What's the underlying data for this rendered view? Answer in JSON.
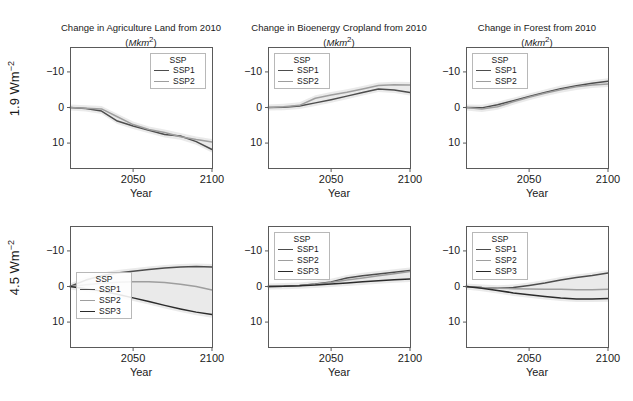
{
  "figure": {
    "row_labels": [
      "1.9 Wm−2",
      "4.5 Wm−2"
    ],
    "x_axis_label": "Year",
    "x_ticks": [
      "2050",
      "2100"
    ],
    "y_ticks": [
      "10",
      "0",
      "−10"
    ],
    "legend_title": "SSP",
    "colors": {
      "SSP1": "#4d4d4d",
      "SSP2": "#9e9e9e",
      "SSP3": "#2b2b2b",
      "frame": "#5a5a5a",
      "ribbon": "#d9d9d9",
      "background": "#ffffff",
      "text": "#1a1a1a"
    }
  },
  "chart_data": [
    {
      "id": "agriculture-1p9",
      "type": "line",
      "title": "Change in Agriculture Land from 2010",
      "subtitle": "(Mkm2)",
      "row": "1.9 Wm−2",
      "column": "Agriculture Land",
      "xlabel": "Year",
      "ylabel": "1.9 Wm−2",
      "xlim": [
        2010,
        2100
      ],
      "ylim": [
        -17,
        17
      ],
      "xticks": [
        2050,
        2100
      ],
      "yticks": [
        -10,
        0,
        10
      ],
      "grid": false,
      "legend_position": "top-right",
      "legend_entries": [
        "SSP1",
        "SSP2"
      ],
      "x": [
        2010,
        2020,
        2030,
        2040,
        2050,
        2060,
        2070,
        2080,
        2090,
        2100
      ],
      "series": [
        {
          "name": "SSP1",
          "values": [
            0.0,
            -0.3,
            -1.0,
            -3.8,
            -5.2,
            -6.4,
            -7.6,
            -8.0,
            -9.6,
            -11.8
          ]
        },
        {
          "name": "SSP2",
          "values": [
            0.0,
            -0.2,
            -0.4,
            -2.6,
            -4.8,
            -6.2,
            -7.0,
            -8.2,
            -9.0,
            -9.7
          ]
        }
      ]
    },
    {
      "id": "bioenergy-1p9",
      "type": "line",
      "title": "Change in Bioenergy Cropland from 2010",
      "subtitle": "(Mkm2)",
      "row": "1.9 Wm−2",
      "column": "Bioenergy Cropland",
      "xlabel": "Year",
      "ylabel": "1.9 Wm−2",
      "xlim": [
        2010,
        2100
      ],
      "ylim": [
        -17,
        17
      ],
      "xticks": [
        2050,
        2100
      ],
      "yticks": [
        -10,
        0,
        10
      ],
      "grid": false,
      "legend_position": "top-left",
      "legend_entries": [
        "SSP1",
        "SSP2"
      ],
      "x": [
        2010,
        2020,
        2030,
        2040,
        2050,
        2060,
        2070,
        2080,
        2090,
        2100
      ],
      "series": [
        {
          "name": "SSP1",
          "values": [
            0.0,
            0.1,
            0.4,
            1.3,
            2.2,
            3.2,
            4.2,
            5.2,
            4.9,
            4.2
          ]
        },
        {
          "name": "SSP2",
          "values": [
            0.0,
            0.2,
            0.6,
            2.6,
            3.5,
            4.3,
            5.2,
            6.2,
            6.4,
            6.3
          ]
        }
      ]
    },
    {
      "id": "forest-1p9",
      "type": "line",
      "title": "Change in Forest from 2010",
      "subtitle": "(Mkm2)",
      "row": "1.9 Wm−2",
      "column": "Forest",
      "xlabel": "Year",
      "ylabel": "1.9 Wm−2",
      "xlim": [
        2010,
        2100
      ],
      "ylim": [
        -17,
        17
      ],
      "xticks": [
        2050,
        2100
      ],
      "yticks": [
        -10,
        0,
        10
      ],
      "grid": false,
      "legend_position": "top-left",
      "legend_entries": [
        "SSP1",
        "SSP2"
      ],
      "x": [
        2010,
        2020,
        2030,
        2040,
        2050,
        2060,
        2070,
        2080,
        2090,
        2100
      ],
      "series": [
        {
          "name": "SSP1",
          "values": [
            0.0,
            -0.1,
            0.8,
            1.9,
            3.1,
            4.2,
            5.3,
            6.1,
            6.8,
            7.4
          ]
        },
        {
          "name": "SSP2",
          "values": [
            0.0,
            -0.4,
            0.2,
            1.6,
            2.9,
            4.0,
            5.0,
            5.8,
            6.3,
            6.6
          ]
        }
      ]
    },
    {
      "id": "agriculture-4p5",
      "type": "line",
      "title": "Change in Agriculture Land from 2010",
      "subtitle": "(Mkm2)",
      "row": "4.5 Wm−2",
      "column": "Agriculture Land",
      "xlabel": "Year",
      "ylabel": "4.5 Wm−2",
      "xlim": [
        2010,
        2100
      ],
      "ylim": [
        -17,
        17
      ],
      "xticks": [
        2050,
        2100
      ],
      "yticks": [
        -10,
        0,
        10
      ],
      "grid": false,
      "legend_position": "bottom-left",
      "legend_entries": [
        "SSP1",
        "SSP2",
        "SSP3"
      ],
      "x": [
        2010,
        2020,
        2030,
        2040,
        2050,
        2060,
        2070,
        2080,
        2090,
        2100
      ],
      "series": [
        {
          "name": "SSP1",
          "values": [
            0.0,
            1.8,
            3.0,
            3.8,
            4.3,
            4.8,
            5.2,
            5.5,
            5.6,
            5.5
          ]
        },
        {
          "name": "SSP2",
          "values": [
            0.0,
            0.5,
            0.9,
            1.2,
            1.3,
            1.3,
            1.1,
            0.6,
            0.0,
            -1.0
          ]
        },
        {
          "name": "SSP3",
          "values": [
            0.0,
            -0.6,
            -1.3,
            -2.2,
            -3.2,
            -4.2,
            -5.3,
            -6.3,
            -7.2,
            -7.9
          ]
        }
      ]
    },
    {
      "id": "bioenergy-4p5",
      "type": "line",
      "title": "Change in Bioenergy Cropland from 2010",
      "subtitle": "(Mkm2)",
      "row": "4.5 Wm−2",
      "column": "Bioenergy Cropland",
      "xlabel": "Year",
      "ylabel": "4.5 Wm−2",
      "xlim": [
        2010,
        2100
      ],
      "ylim": [
        -17,
        17
      ],
      "xticks": [
        2050,
        2100
      ],
      "yticks": [
        -10,
        0,
        10
      ],
      "grid": false,
      "legend_position": "top-left",
      "legend_entries": [
        "SSP1",
        "SSP2",
        "SSP3"
      ],
      "x": [
        2010,
        2020,
        2030,
        2040,
        2050,
        2060,
        2070,
        2080,
        2090,
        2100
      ],
      "series": [
        {
          "name": "SSP1",
          "values": [
            0.0,
            0.1,
            0.3,
            0.7,
            1.3,
            2.4,
            3.0,
            3.5,
            4.0,
            4.5
          ]
        },
        {
          "name": "SSP2",
          "values": [
            0.0,
            0.1,
            0.3,
            0.6,
            1.1,
            1.8,
            2.4,
            3.0,
            3.6,
            4.2
          ]
        },
        {
          "name": "SSP3",
          "values": [
            0.0,
            0.1,
            0.2,
            0.4,
            0.7,
            1.0,
            1.3,
            1.6,
            1.9,
            2.1
          ]
        }
      ]
    },
    {
      "id": "forest-4p5",
      "type": "line",
      "title": "Change in Forest from 2010",
      "subtitle": "(Mkm2)",
      "row": "4.5 Wm−2",
      "column": "Forest",
      "xlabel": "Year",
      "ylabel": "4.5 Wm−2",
      "xlim": [
        2010,
        2100
      ],
      "ylim": [
        -17,
        17
      ],
      "xticks": [
        2050,
        2100
      ],
      "yticks": [
        -10,
        0,
        10
      ],
      "grid": false,
      "legend_position": "top-left",
      "legend_entries": [
        "SSP1",
        "SSP2",
        "SSP3"
      ],
      "x": [
        2010,
        2020,
        2030,
        2040,
        2050,
        2060,
        2070,
        2080,
        2090,
        2100
      ],
      "series": [
        {
          "name": "SSP1",
          "values": [
            0.0,
            -0.3,
            -0.5,
            -0.3,
            0.3,
            1.0,
            1.8,
            2.5,
            3.1,
            3.8
          ]
        },
        {
          "name": "SSP2",
          "values": [
            0.0,
            -0.3,
            -0.5,
            -0.6,
            -0.7,
            -0.8,
            -0.8,
            -0.9,
            -0.9,
            -0.8
          ]
        },
        {
          "name": "SSP3",
          "values": [
            0.0,
            -0.5,
            -1.1,
            -1.8,
            -2.3,
            -2.8,
            -3.2,
            -3.5,
            -3.5,
            -3.4
          ]
        }
      ]
    }
  ]
}
